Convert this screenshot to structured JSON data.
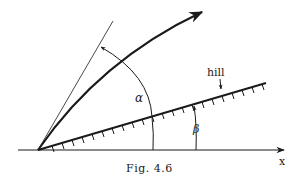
{
  "figure": {
    "caption": "Fig. 4.6",
    "labels": {
      "alpha": "α",
      "beta": "β",
      "hill": "hill",
      "x_axis": "x"
    }
  },
  "colors": {
    "ink": "#1a1a1a",
    "background": "#ffffff"
  },
  "geometry": {
    "origin": [
      38,
      150
    ],
    "x_axis_end": [
      284,
      150
    ],
    "hill_line_end": [
      266,
      83
    ],
    "tangent_line_end": [
      113,
      21
    ],
    "trajectory_end": [
      202,
      12
    ],
    "alpha_arc_label_pos": [
      128,
      103
    ],
    "beta_arc_label_pos": [
      193,
      131
    ]
  }
}
